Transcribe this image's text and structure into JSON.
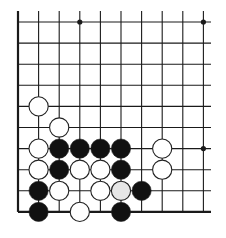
{
  "board": {
    "description": "Go diagram, lower-left corner region",
    "columns": 10,
    "rows": 10,
    "origin_x": 18,
    "origin_y": 22,
    "spacing_x": 20.6,
    "spacing_y": 21.1,
    "line_color": "#1a1a1a",
    "edges": {
      "left": true,
      "bottom": true,
      "top": false,
      "right": false
    },
    "star_points": [
      [
        3,
        0
      ],
      [
        9,
        0
      ],
      [
        9,
        6
      ]
    ],
    "stones": [
      {
        "col": 1,
        "row": 4,
        "color": "white"
      },
      {
        "col": 2,
        "row": 5,
        "color": "white"
      },
      {
        "col": 1,
        "row": 6,
        "color": "white"
      },
      {
        "col": 2,
        "row": 6,
        "color": "black"
      },
      {
        "col": 3,
        "row": 6,
        "color": "black"
      },
      {
        "col": 4,
        "row": 6,
        "color": "black"
      },
      {
        "col": 5,
        "row": 6,
        "color": "black"
      },
      {
        "col": 7,
        "row": 6,
        "color": "white"
      },
      {
        "col": 1,
        "row": 7,
        "color": "white"
      },
      {
        "col": 2,
        "row": 7,
        "color": "black"
      },
      {
        "col": 3,
        "row": 7,
        "color": "white"
      },
      {
        "col": 4,
        "row": 7,
        "color": "white"
      },
      {
        "col": 5,
        "row": 7,
        "color": "black"
      },
      {
        "col": 7,
        "row": 7,
        "color": "white"
      },
      {
        "col": 1,
        "row": 8,
        "color": "black"
      },
      {
        "col": 2,
        "row": 8,
        "color": "white"
      },
      {
        "col": 4,
        "row": 8,
        "color": "white"
      },
      {
        "col": 5,
        "row": 8,
        "color": "lightgray"
      },
      {
        "col": 6,
        "row": 8,
        "color": "black"
      },
      {
        "col": 1,
        "row": 9,
        "color": "black"
      },
      {
        "col": 3,
        "row": 9,
        "color": "white"
      },
      {
        "col": 5,
        "row": 9,
        "color": "black"
      }
    ],
    "colors": {
      "black": "#111111",
      "white": "#ffffff",
      "lightgray": "#e6e6e6"
    }
  }
}
